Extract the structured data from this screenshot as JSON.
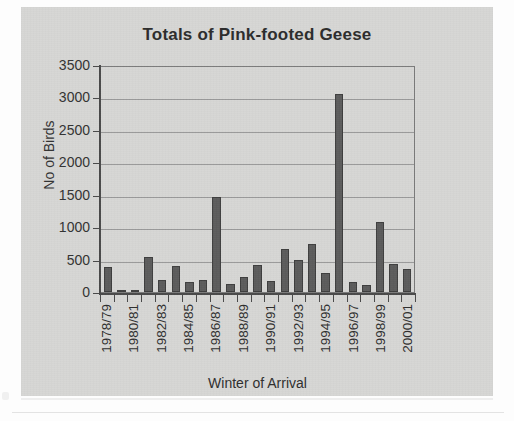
{
  "chart": {
    "title": "Totals of Pink-footed Geese",
    "y_axis_title": "No of Birds",
    "x_axis_title": "Winter of Arrival",
    "bar_color": "#5c5c5c",
    "background_color": "#d7d7d5",
    "gridline_color": "#8f8f8f",
    "axis_color": "#4a4a4a"
  },
  "chart_data": {
    "type": "bar",
    "title": "Totals of Pink-footed Geese",
    "xlabel": "Winter of Arrival",
    "ylabel": "No of Birds",
    "ylim": [
      0,
      3500
    ],
    "ytick_labels": [
      "3500",
      "3000",
      "2500",
      "2000",
      "1500",
      "1000",
      "500",
      "0"
    ],
    "ytick_values": [
      3500,
      3000,
      2500,
      2000,
      1500,
      1000,
      500,
      0
    ],
    "grid": true,
    "legend": false,
    "categories": [
      "1978/79",
      "",
      "1980/81",
      "",
      "1982/83",
      "",
      "1984/85",
      "",
      "1986/87",
      "",
      "1988/89",
      "",
      "1990/91",
      "",
      "1992/93",
      "",
      "1994/95",
      "",
      "1996/97",
      "",
      "1998/99",
      "",
      "2000/01"
    ],
    "all_categories": [
      "1978/79",
      "1979/80",
      "1980/81",
      "1981/82",
      "1982/83",
      "1983/84",
      "1984/85",
      "1985/86",
      "1986/87",
      "1987/88",
      "1988/89",
      "1989/90",
      "1990/91",
      "1991/92",
      "1992/93",
      "1993/94",
      "1994/95",
      "1995/96",
      "1996/97",
      "1997/98",
      "1998/99",
      "1999/00",
      "2000/01"
    ],
    "values": [
      385,
      30,
      30,
      540,
      180,
      400,
      160,
      180,
      1470,
      130,
      230,
      420,
      170,
      660,
      500,
      740,
      300,
      3050,
      150,
      110,
      1080,
      430,
      350
    ]
  }
}
